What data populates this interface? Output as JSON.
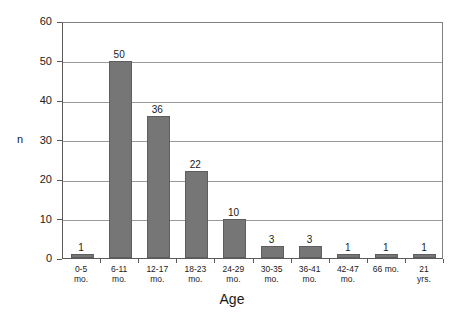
{
  "chart_data": {
    "type": "bar",
    "title": "",
    "xlabel": "Age",
    "ylabel": "n",
    "categories": [
      "0-5\nmo.",
      "6-11\nmo.",
      "12-17\nmo.",
      "18-23\nmo.",
      "24-29\nmo.",
      "30-35\nmo.",
      "36-41\nmo.",
      "42-47\nmo.",
      "66 mo.",
      "21\nyrs."
    ],
    "category_lines": [
      [
        "0-5",
        "mo."
      ],
      [
        "6-11",
        "mo."
      ],
      [
        "12-17",
        "mo."
      ],
      [
        "18-23",
        "mo."
      ],
      [
        "24-29",
        "mo."
      ],
      [
        "30-35",
        "mo."
      ],
      [
        "36-41",
        "mo."
      ],
      [
        "42-47",
        "mo."
      ],
      [
        "66 mo."
      ],
      [
        "21",
        "yrs."
      ]
    ],
    "values": [
      1,
      50,
      36,
      22,
      10,
      3,
      3,
      1,
      1,
      1
    ],
    "value_labels": [
      "1",
      "50",
      "36",
      "22",
      "10",
      "3",
      "3",
      "1",
      "1",
      "1"
    ],
    "ylim": [
      0,
      60
    ],
    "yticks": [
      0,
      10,
      20,
      30,
      40,
      50,
      60
    ],
    "ytick_labels": [
      "0",
      "10",
      "20",
      "30",
      "40",
      "50",
      "60"
    ],
    "grid": true,
    "grid_axis": "y",
    "legend": false,
    "bar_color": "#767676",
    "bar_edge_color": "#5e5e5e",
    "grid_color": "#9a9a9a",
    "axis_color": "#5a5a5a",
    "background_color": "#ffffff"
  }
}
